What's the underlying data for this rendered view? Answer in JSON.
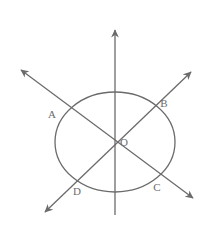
{
  "figure": {
    "background_color": "#ffffff",
    "stroke_color": "#6b6b6b",
    "label_color": "#6b6b6b",
    "canvas": {
      "width": 212,
      "height": 233
    }
  },
  "shapes": {
    "ellipse": {
      "name": "ellipse",
      "cx": 115,
      "cy": 142,
      "rx": 60,
      "ry": 50,
      "stroke": "#6b6b6b",
      "stroke_width": 1.3,
      "fill": "none"
    },
    "lines": [
      {
        "name": "vertical-line",
        "x1": 115,
        "y1": 28,
        "x2": 115,
        "y2": 215,
        "arrow_start": true,
        "arrow_end": false,
        "stroke": "#6b6b6b",
        "stroke_width": 1.3
      },
      {
        "name": "line-a-c",
        "x1": 18,
        "y1": 68,
        "x2": 196,
        "y2": 200,
        "arrow_start": true,
        "arrow_end": true,
        "stroke": "#6b6b6b",
        "stroke_width": 1.3
      },
      {
        "name": "line-d-b",
        "x1": 42,
        "y1": 215,
        "x2": 194,
        "y2": 69,
        "arrow_start": true,
        "arrow_end": true,
        "stroke": "#6b6b6b",
        "stroke_width": 1.3
      }
    ]
  },
  "labels": {
    "a": {
      "text": "A",
      "x": 52,
      "y": 118
    },
    "b": {
      "text": "B",
      "x": 162,
      "y": 107
    },
    "o": {
      "text": "O",
      "x": 122,
      "y": 146
    },
    "c": {
      "text": "C",
      "x": 155,
      "y": 190
    },
    "d": {
      "text": "D",
      "x": 75,
      "y": 194
    }
  },
  "points": {
    "a": {
      "name": "intersection-a",
      "x": 67,
      "y": 115
    },
    "b": {
      "name": "intersection-b",
      "x": 160,
      "y": 113
    },
    "o": {
      "name": "center-o",
      "x": 115,
      "y": 142
    },
    "c": {
      "name": "intersection-c",
      "x": 166,
      "y": 178
    },
    "d": {
      "name": "intersection-d",
      "x": 72,
      "y": 177
    }
  }
}
